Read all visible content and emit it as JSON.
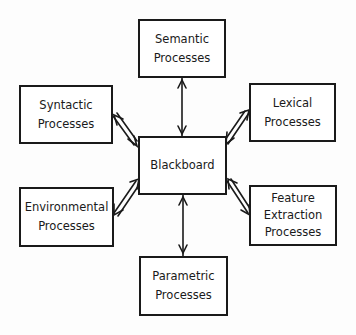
{
  "diagram": {
    "center": {
      "id": "blackboard",
      "lines": [
        "Blackboard"
      ]
    },
    "nodes": [
      {
        "id": "semantic",
        "lines": [
          "Semantic",
          "Processes"
        ]
      },
      {
        "id": "syntactic",
        "lines": [
          "Syntactic",
          "Processes"
        ]
      },
      {
        "id": "lexical",
        "lines": [
          "Lexical",
          "Processes"
        ]
      },
      {
        "id": "environmental",
        "lines": [
          "Environmental",
          "Processes"
        ]
      },
      {
        "id": "feature-extraction",
        "lines": [
          "Feature",
          "Extraction",
          "Processes"
        ]
      },
      {
        "id": "parametric",
        "lines": [
          "Parametric",
          "Processes"
        ]
      }
    ],
    "edges": [
      {
        "from": "blackboard",
        "to": "semantic",
        "type": "bidirectional"
      },
      {
        "from": "blackboard",
        "to": "syntactic",
        "type": "bidirectional"
      },
      {
        "from": "blackboard",
        "to": "lexical",
        "type": "bidirectional"
      },
      {
        "from": "blackboard",
        "to": "environmental",
        "type": "bidirectional"
      },
      {
        "from": "blackboard",
        "to": "feature-extraction",
        "type": "bidirectional"
      },
      {
        "from": "blackboard",
        "to": "parametric",
        "type": "bidirectional"
      }
    ]
  }
}
